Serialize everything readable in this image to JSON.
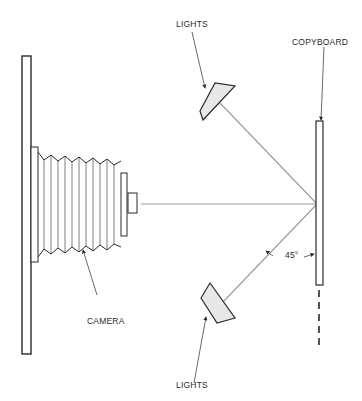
{
  "figure": {
    "labels": {
      "lights_top": "LIGHTS",
      "lights_bottom": "LIGHTS",
      "copyboard": "COPYBOARD",
      "camera": "CAMERA",
      "angle": "45°"
    },
    "colors": {
      "stroke": "#2a2a2a",
      "ray": "#9a9a9a",
      "light_fill": "#e8e8e8",
      "background": "#ffffff"
    }
  }
}
